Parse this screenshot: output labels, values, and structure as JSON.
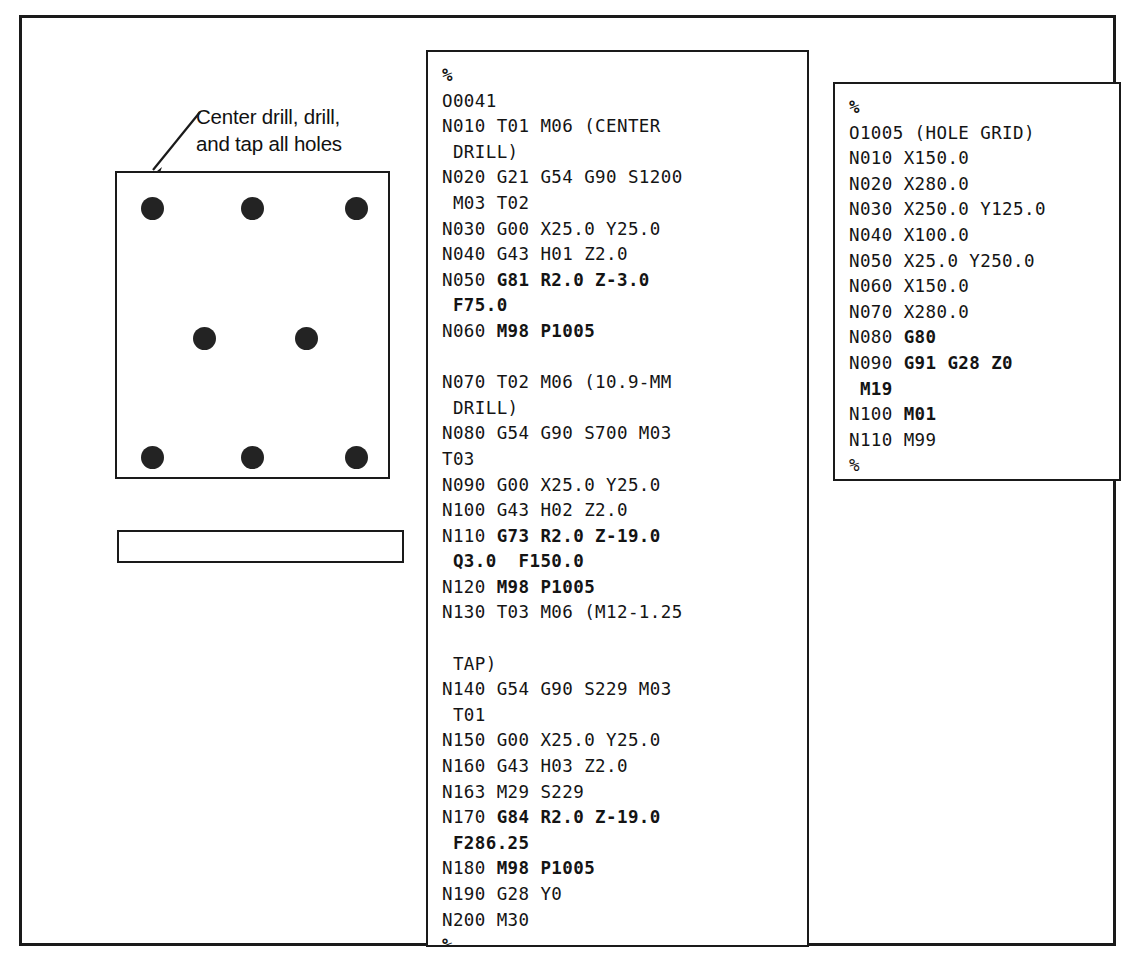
{
  "figure": {
    "annotation": {
      "label": "Center drill, drill,\nand tap all holes",
      "leader_icon": "arrow-leader-icon"
    },
    "drawing": {
      "top_view_name": "part-top-view",
      "side_view_name": "part-side-view",
      "hole_count": 8,
      "holes": [
        {
          "cx": 35,
          "cy": 35
        },
        {
          "cx": 135,
          "cy": 35
        },
        {
          "cx": 239,
          "cy": 35
        },
        {
          "cx": 87,
          "cy": 165
        },
        {
          "cx": 189,
          "cy": 165
        },
        {
          "cx": 35,
          "cy": 284
        },
        {
          "cx": 135,
          "cy": 284
        },
        {
          "cx": 239,
          "cy": 284
        }
      ]
    }
  },
  "main_program": {
    "title": "O0041",
    "lines": [
      [
        {
          "t": "%",
          "b": true
        }
      ],
      [
        {
          "t": "O0041",
          "b": false
        }
      ],
      [
        {
          "t": "N010 T01 M06 (CENTER",
          "b": false
        }
      ],
      [
        {
          "t": " DRILL)",
          "b": false
        }
      ],
      [
        {
          "t": "N020 G21 G54 G90 S1200",
          "b": false
        }
      ],
      [
        {
          "t": " M03 T02",
          "b": false
        }
      ],
      [
        {
          "t": "N030 G00 X25.0 Y25.0",
          "b": false
        }
      ],
      [
        {
          "t": "N040 G43 H01 Z2.0",
          "b": false
        }
      ],
      [
        {
          "t": "N050 ",
          "b": false
        },
        {
          "t": "G81 R2.0 Z-3.0",
          "b": true
        }
      ],
      [
        {
          "t": " ",
          "b": false
        },
        {
          "t": "F75.0",
          "b": true
        }
      ],
      [
        {
          "t": "N060 ",
          "b": false
        },
        {
          "t": "M98 P1005",
          "b": true
        }
      ],
      [
        {
          "t": "",
          "b": false
        }
      ],
      [
        {
          "t": "N070 T02 M06 (10.9-MM",
          "b": false
        }
      ],
      [
        {
          "t": " DRILL)",
          "b": false
        }
      ],
      [
        {
          "t": "N080 G54 G90 S700 M03",
          "b": false
        }
      ],
      [
        {
          "t": "T03",
          "b": false
        }
      ],
      [
        {
          "t": "N090 G00 X25.0 Y25.0",
          "b": false
        }
      ],
      [
        {
          "t": "N100 G43 H02 Z2.0",
          "b": false
        }
      ],
      [
        {
          "t": "N110 ",
          "b": false
        },
        {
          "t": "G73 R2.0 Z-19.0",
          "b": true
        }
      ],
      [
        {
          "t": " ",
          "b": false
        },
        {
          "t": "Q3.0  F150.0",
          "b": true
        }
      ],
      [
        {
          "t": "N120 ",
          "b": false
        },
        {
          "t": "M98 P1005",
          "b": true
        }
      ],
      [
        {
          "t": "N130 T03 M06 (M12-1.25",
          "b": false
        }
      ],
      [
        {
          "t": "",
          "b": false
        }
      ],
      [
        {
          "t": " TAP)",
          "b": false
        }
      ],
      [
        {
          "t": "N140 G54 G90 S229 M03",
          "b": false
        }
      ],
      [
        {
          "t": " T01",
          "b": false
        }
      ],
      [
        {
          "t": "N150 G00 X25.0 Y25.0",
          "b": false
        }
      ],
      [
        {
          "t": "N160 G43 H03 Z2.0",
          "b": false
        }
      ],
      [
        {
          "t": "N163 M29 S229",
          "b": false
        }
      ],
      [
        {
          "t": "N170 ",
          "b": false
        },
        {
          "t": "G84 R2.0 Z-19.0",
          "b": true
        }
      ],
      [
        {
          "t": " ",
          "b": false
        },
        {
          "t": "F286.25",
          "b": true
        }
      ],
      [
        {
          "t": "N180 ",
          "b": false
        },
        {
          "t": "M98 P1005",
          "b": true
        }
      ],
      [
        {
          "t": "N190 G28 Y0",
          "b": false
        }
      ],
      [
        {
          "t": "N200 M30",
          "b": false
        }
      ],
      [
        {
          "t": "%",
          "b": true
        }
      ]
    ]
  },
  "subprogram": {
    "title": "O1005 (HOLE GRID)",
    "lines": [
      [
        {
          "t": "%",
          "b": true
        }
      ],
      [
        {
          "t": "O1005 (HOLE GRID)",
          "b": false
        }
      ],
      [
        {
          "t": "N010 X150.0",
          "b": false
        }
      ],
      [
        {
          "t": "N020 X280.0",
          "b": false
        }
      ],
      [
        {
          "t": "N030 X250.0 Y125.0",
          "b": false
        }
      ],
      [
        {
          "t": "N040 X100.0",
          "b": false
        }
      ],
      [
        {
          "t": "N050 X25.0 Y250.0",
          "b": false
        }
      ],
      [
        {
          "t": "N060 X150.0",
          "b": false
        }
      ],
      [
        {
          "t": "N070 X280.0",
          "b": false
        }
      ],
      [
        {
          "t": "N080 ",
          "b": false
        },
        {
          "t": "G80",
          "b": true
        }
      ],
      [
        {
          "t": "N090 ",
          "b": false
        },
        {
          "t": "G91 G28 Z0",
          "b": true
        }
      ],
      [
        {
          "t": " ",
          "b": false
        },
        {
          "t": "M19",
          "b": true
        }
      ],
      [
        {
          "t": "N100 ",
          "b": false
        },
        {
          "t": "M01",
          "b": true
        }
      ],
      [
        {
          "t": "N110 M99",
          "b": false
        }
      ],
      [
        {
          "t": "%",
          "b": false
        }
      ]
    ]
  },
  "colors": {
    "ink": "#1a1a1a",
    "hole_fill": "#232323",
    "background": "#ffffff"
  }
}
